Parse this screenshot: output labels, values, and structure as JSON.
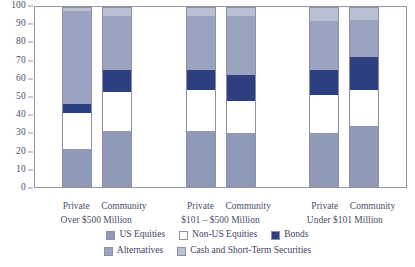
{
  "chart_data": {
    "type": "bar",
    "subtype": "stacked-bar",
    "title": "",
    "xlabel": "",
    "ylabel": "",
    "ylim": [
      0,
      100
    ],
    "ytick_labels": [
      "100",
      "90",
      "80",
      "70",
      "60",
      "50",
      "40",
      "30",
      "20",
      "10",
      "0"
    ],
    "yticks": [
      100,
      90,
      80,
      70,
      60,
      50,
      40,
      30,
      20,
      10,
      0
    ],
    "grid": false,
    "legend_position": "bottom",
    "categories": [
      "Private Over $500 Million",
      "Community Over $500 Million",
      "Private $101 – $500 Million",
      "Community $101 – $500 Million",
      "Private Under $101 Million",
      "Community Under $101 Million"
    ],
    "series": [
      {
        "name": "US Equities",
        "color": "#8f9ab9",
        "values": [
          21,
          31,
          31,
          30,
          30,
          34
        ]
      },
      {
        "name": "Non-US Equities",
        "color": "#ffffff",
        "values": [
          20,
          22,
          23,
          18,
          21,
          20
        ]
      },
      {
        "name": "Bonds",
        "color": "#2d3f80",
        "values": [
          5,
          12,
          11,
          14,
          14,
          18
        ]
      },
      {
        "name": "Alternatives",
        "color": "#9aa3c0",
        "values": [
          52,
          30,
          30,
          33,
          27,
          21
        ]
      },
      {
        "name": "Cash and Short-Term Securities",
        "color": "#b9c0d2",
        "values": [
          2,
          5,
          5,
          5,
          8,
          7
        ]
      }
    ]
  },
  "groups": [
    {
      "range_label": "Over $500 Million",
      "bars": [
        {
          "label": "Private",
          "values": [
            21,
            20,
            5,
            52,
            2
          ]
        },
        {
          "label": "Community",
          "values": [
            31,
            22,
            12,
            30,
            5
          ]
        }
      ]
    },
    {
      "range_label": "$101 – $500 Million",
      "bars": [
        {
          "label": "Private",
          "values": [
            31,
            23,
            11,
            30,
            5
          ]
        },
        {
          "label": "Community",
          "values": [
            30,
            18,
            14,
            33,
            5
          ]
        }
      ]
    },
    {
      "range_label": "Under $101 Million",
      "bars": [
        {
          "label": "Private",
          "values": [
            30,
            21,
            14,
            27,
            8
          ]
        },
        {
          "label": "Community",
          "values": [
            34,
            20,
            18,
            21,
            7
          ]
        }
      ]
    }
  ],
  "legend": {
    "row1": [
      {
        "label": "US Equities",
        "color": "#8f9ab9"
      },
      {
        "label": "Non-US Equities",
        "color": "#ffffff"
      },
      {
        "label": "Bonds",
        "color": "#2d3f80"
      }
    ],
    "row2": [
      {
        "label": "Alternatives",
        "color": "#9aa3c0"
      },
      {
        "label": "Cash and Short-Term Securities",
        "color": "#b9c0d2"
      }
    ]
  }
}
